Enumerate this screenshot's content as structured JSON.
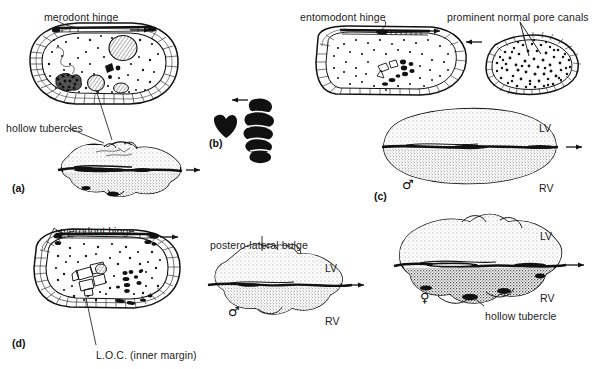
{
  "figure": {
    "background_color": "#ffffff",
    "ink_color": "#1b1b1b",
    "width": 600,
    "height": 369
  },
  "panels": [
    {
      "id": "(a)",
      "x": 12,
      "y": 182
    },
    {
      "id": "(b)",
      "x": 209,
      "y": 137
    },
    {
      "id": "(c)",
      "x": 374,
      "y": 190
    },
    {
      "id": "(d)",
      "x": 12,
      "y": 337
    }
  ],
  "annotations": [
    {
      "name": "merodont-hinge-a",
      "text": "merodont hinge",
      "x": 44,
      "y": 11
    },
    {
      "name": "hollow-tubercles-a",
      "text": "hollow tubercles",
      "x": 6,
      "y": 122
    },
    {
      "name": "entomodont-hinge-c",
      "text": "entomodont hinge",
      "x": 300,
      "y": 11
    },
    {
      "name": "prominent-normal-pore-canals-c",
      "text": "prominent normal pore canals",
      "x": 447,
      "y": 11
    },
    {
      "name": "merodont-hinge-d",
      "text": "merodont hinge",
      "x": 60,
      "y": 225
    },
    {
      "name": "loc-inner-margin-d",
      "text": "L.O.C. (inner margin)",
      "x": 96,
      "y": 349
    },
    {
      "name": "postero-lateral-bulge-d",
      "text": "postero-lateral bulge",
      "x": 210,
      "y": 239
    },
    {
      "name": "hollow-tubercle-female",
      "text": "hollow tubercle",
      "x": 485,
      "y": 310
    }
  ],
  "valve_labels": [
    {
      "name": "valve-label-lv-c",
      "text": "LV",
      "x": 539,
      "y": 122
    },
    {
      "name": "valve-label-rv-c",
      "text": "RV",
      "x": 539,
      "y": 182
    },
    {
      "name": "valve-label-lv-male",
      "text": "LV",
      "x": 325,
      "y": 262
    },
    {
      "name": "valve-label-rv-male",
      "text": "RV",
      "x": 325,
      "y": 315
    },
    {
      "name": "valve-label-lv-female",
      "text": "LV",
      "x": 540,
      "y": 230
    },
    {
      "name": "valve-label-rv-female",
      "text": "RV",
      "x": 540,
      "y": 292
    }
  ],
  "sex_symbols": [
    {
      "name": "male-symbol-c",
      "glyph": "♂",
      "x": 402,
      "y": 178
    },
    {
      "name": "male-symbol-d",
      "glyph": "♂",
      "x": 228,
      "y": 305
    },
    {
      "name": "female-symbol-female",
      "glyph": "♀",
      "x": 420,
      "y": 291
    }
  ]
}
